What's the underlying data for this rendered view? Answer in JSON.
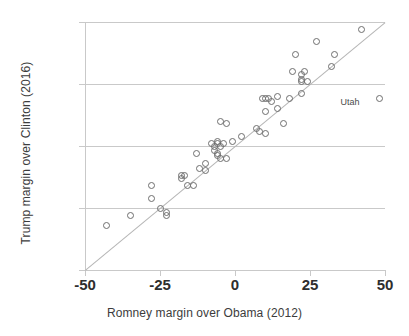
{
  "chart_data": {
    "type": "scatter",
    "title": "",
    "xlabel": "Romney margin over Obama (2012)",
    "ylabel": "Trump margin over Clinton (2016)",
    "xlim": [
      -50,
      50
    ],
    "ylim": [
      -50,
      50
    ],
    "xticks": [
      -50,
      -25,
      0,
      25,
      50
    ],
    "yticks": [
      -50,
      -25,
      0,
      25,
      50
    ],
    "xtick_labels": [
      "-50",
      "-25",
      "0",
      "25",
      "50"
    ],
    "ytick_labels": [
      "-50",
      "-25",
      "0",
      "25",
      "50"
    ],
    "grid": "horizontal",
    "legend": "none",
    "marker": "open-circle",
    "marker_color": "#6e6e6e",
    "gridline_color": "#c9c9c9",
    "reference_line": {
      "label": "y = x",
      "from": [
        -50,
        -50
      ],
      "to": [
        50,
        50
      ],
      "color": "#b5b5b5"
    },
    "annotations": [
      {
        "text": "Utah",
        "x": 42.5,
        "y": 17.5
      }
    ],
    "points": [
      {
        "x": -43,
        "y": -32
      },
      {
        "x": -35,
        "y": -28
      },
      {
        "x": -28,
        "y": -16
      },
      {
        "x": -28,
        "y": -21
      },
      {
        "x": -25,
        "y": -25
      },
      {
        "x": -23,
        "y": -27
      },
      {
        "x": -23,
        "y": -28
      },
      {
        "x": -18,
        "y": -12
      },
      {
        "x": -18,
        "y": -13
      },
      {
        "x": -17,
        "y": -12
      },
      {
        "x": -16,
        "y": -16
      },
      {
        "x": -14,
        "y": -16
      },
      {
        "x": -13,
        "y": -3
      },
      {
        "x": -12,
        "y": -9
      },
      {
        "x": -10,
        "y": -7
      },
      {
        "x": -10,
        "y": -10
      },
      {
        "x": -8,
        "y": 1
      },
      {
        "x": -7,
        "y": 0
      },
      {
        "x": -7,
        "y": -2
      },
      {
        "x": -6,
        "y": 1
      },
      {
        "x": -6,
        "y": 2
      },
      {
        "x": -6,
        "y": -3
      },
      {
        "x": -6,
        "y": -4
      },
      {
        "x": -5,
        "y": 0
      },
      {
        "x": -5,
        "y": 10
      },
      {
        "x": -5,
        "y": -5
      },
      {
        "x": -4,
        "y": 1
      },
      {
        "x": -3,
        "y": 9
      },
      {
        "x": -3,
        "y": -5
      },
      {
        "x": -1,
        "y": 2
      },
      {
        "x": 2,
        "y": 4
      },
      {
        "x": 7,
        "y": 7
      },
      {
        "x": 8,
        "y": 6
      },
      {
        "x": 9,
        "y": 19
      },
      {
        "x": 10,
        "y": 19
      },
      {
        "x": 10,
        "y": 14
      },
      {
        "x": 10,
        "y": 5
      },
      {
        "x": 11,
        "y": 19
      },
      {
        "x": 12,
        "y": 18
      },
      {
        "x": 14,
        "y": 20
      },
      {
        "x": 14,
        "y": 15
      },
      {
        "x": 16,
        "y": 9
      },
      {
        "x": 18,
        "y": 19
      },
      {
        "x": 19,
        "y": 30
      },
      {
        "x": 20,
        "y": 37
      },
      {
        "x": 22,
        "y": 26
      },
      {
        "x": 22,
        "y": 27
      },
      {
        "x": 22,
        "y": 29
      },
      {
        "x": 22,
        "y": 21
      },
      {
        "x": 23,
        "y": 30
      },
      {
        "x": 24,
        "y": 26
      },
      {
        "x": 27,
        "y": 42
      },
      {
        "x": 32,
        "y": 32
      },
      {
        "x": 33,
        "y": 37
      },
      {
        "x": 42,
        "y": 47
      },
      {
        "x": 48,
        "y": 19
      }
    ]
  }
}
